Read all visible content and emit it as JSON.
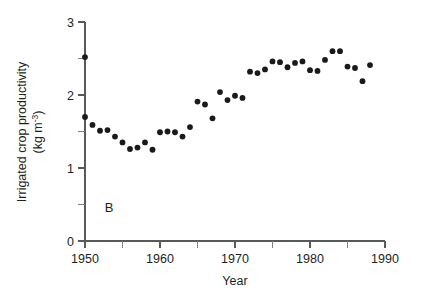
{
  "figure": {
    "panel_label": "B",
    "background_color": "#ffffff",
    "point_color": "#1a1a1a",
    "axis_color": "#58595b"
  },
  "axes": {
    "y": {
      "title_line1": "Irrigated crop productivity",
      "title_line2_prefix": "(kg m",
      "title_line2_sup": "-3",
      "title_line2_suffix": ")",
      "ticks_major": [
        "0",
        "1",
        "2",
        "3"
      ],
      "ticks_major_values": [
        0,
        1,
        2,
        3
      ],
      "ticks_minor_values": [
        0.5,
        1.5,
        2.5
      ],
      "min": 0,
      "max": 3
    },
    "x": {
      "title": "Year",
      "ticks_major": [
        "1950",
        "1960",
        "1970",
        "1980",
        "1990"
      ],
      "ticks_major_values": [
        1950,
        1960,
        1970,
        1980,
        1990
      ],
      "ticks_minor_values": [
        1955,
        1965,
        1975,
        1985
      ],
      "min": 1950,
      "max": 1990
    }
  },
  "chart_data": {
    "type": "scatter",
    "title": "",
    "subtitle": "",
    "xlabel": "Year",
    "ylabel": "Irrigated crop productivity (kg m-3)",
    "xlim": [
      1950,
      1990
    ],
    "ylim": [
      0,
      3
    ],
    "grid": false,
    "legend": "none",
    "annotations": [
      {
        "text": "B",
        "x": 1953,
        "y": 0.45
      }
    ],
    "series": [
      {
        "name": "Irrigated crop productivity",
        "marker": "filled-circle",
        "color": "#1a1a1a",
        "x": [
          1950,
          1950,
          1951,
          1952,
          1953,
          1954,
          1955,
          1956,
          1957,
          1958,
          1959,
          1960,
          1961,
          1962,
          1963,
          1964,
          1965,
          1966,
          1967,
          1968,
          1969,
          1970,
          1971,
          1972,
          1973,
          1974,
          1975,
          1976,
          1977,
          1978,
          1979,
          1980,
          1981,
          1982,
          1983,
          1984,
          1985,
          1986,
          1987,
          1988
        ],
        "y": [
          2.52,
          1.7,
          1.59,
          1.51,
          1.52,
          1.43,
          1.35,
          1.26,
          1.28,
          1.35,
          1.25,
          1.49,
          1.5,
          1.49,
          1.43,
          1.56,
          1.91,
          1.87,
          1.68,
          2.04,
          1.93,
          1.99,
          1.96,
          2.32,
          2.3,
          2.35,
          2.46,
          2.45,
          2.38,
          2.44,
          2.46,
          2.34,
          2.33,
          2.48,
          2.6,
          2.6,
          2.39,
          2.37,
          2.19,
          2.41
        ]
      }
    ]
  }
}
